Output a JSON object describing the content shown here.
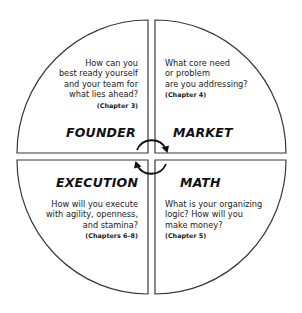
{
  "diagram": {
    "type": "four-quadrant circle",
    "center_cycle_arrows": "clockwise",
    "quadrants": [
      {
        "position": "top-left",
        "title": "FOUNDER",
        "question": "How can you\nbest ready yourself\nand your team for\nwhat lies ahead?",
        "chapter": "(Chapter 3)"
      },
      {
        "position": "top-right",
        "title": "MARKET",
        "question": "What core need\nor problem\nare you addressing?",
        "chapter": "(Chapter 4)"
      },
      {
        "position": "bottom-left",
        "title": "EXECUTION",
        "question": "How will you execute\nwith agility, openness,\nand stamina?",
        "chapter": "(Chapters 6–8)"
      },
      {
        "position": "bottom-right",
        "title": "MATH",
        "question": "What is your organizing\nlogic? How will you\nmake money?",
        "chapter": "(Chapter 5)"
      }
    ],
    "colors": {
      "stroke": "#3a3a3a",
      "text": "#222222",
      "background": "#ffffff"
    }
  }
}
